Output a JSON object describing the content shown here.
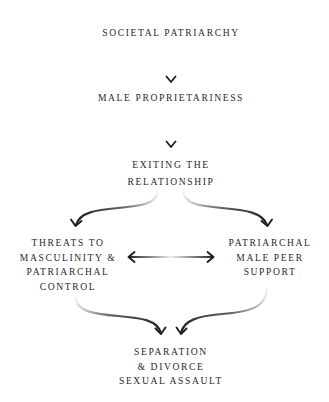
{
  "diagram": {
    "type": "flowchart",
    "nodes": [
      {
        "id": "societal",
        "lines": [
          "SOCIETAL PATRIARCHY"
        ]
      },
      {
        "id": "proprietariness",
        "lines": [
          "MALE PROPRIETARINESS"
        ]
      },
      {
        "id": "exiting",
        "lines": [
          "EXITING THE",
          "RELATIONSHIP"
        ]
      },
      {
        "id": "threats",
        "lines": [
          "THREATS TO",
          "MASCULINITY &",
          "PATRIARCHAL",
          "CONTROL"
        ]
      },
      {
        "id": "peer",
        "lines": [
          "PATRIARCHAL",
          "MALE PEER",
          "SUPPORT"
        ]
      },
      {
        "id": "outcome",
        "lines": [
          "SEPARATION",
          "& DIVORCE",
          "SEXUAL ASSAULT"
        ]
      }
    ],
    "edges": [
      {
        "from": "societal",
        "to": "proprietariness",
        "style": "straight"
      },
      {
        "from": "proprietariness",
        "to": "exiting",
        "style": "straight"
      },
      {
        "from": "exiting",
        "to": "threats",
        "style": "curved"
      },
      {
        "from": "exiting",
        "to": "peer",
        "style": "curved"
      },
      {
        "from": "threats",
        "to": "peer",
        "style": "bidirectional"
      },
      {
        "from": "threats",
        "to": "outcome",
        "style": "curved"
      },
      {
        "from": "peer",
        "to": "outcome",
        "style": "curved"
      }
    ],
    "colors": {
      "text": "#2a2a2a",
      "arrow": "#1e1e1e",
      "background": "#ffffff"
    }
  }
}
